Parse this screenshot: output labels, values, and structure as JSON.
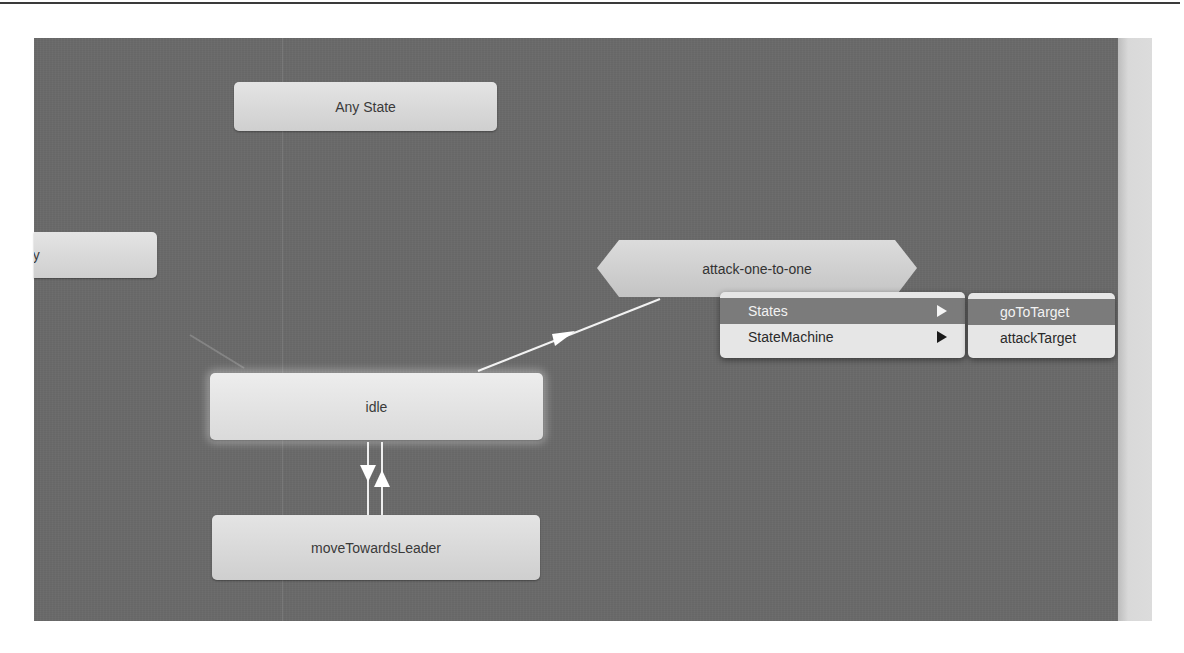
{
  "canvas": {
    "background_color": "#6a6a6a",
    "nodes": [
      {
        "id": "any-state",
        "label": "Any State"
      },
      {
        "id": "entry",
        "label": "ry"
      },
      {
        "id": "attack-one-to-one",
        "label": "attack-one-to-one"
      },
      {
        "id": "idle",
        "label": "idle"
      },
      {
        "id": "move-towards-leader",
        "label": "moveTowardsLeader"
      }
    ],
    "transitions": [
      {
        "from": "idle",
        "to": "attack-one-to-one"
      },
      {
        "from": "idle",
        "to": "moveTowardsLeader"
      },
      {
        "from": "moveTowardsLeader",
        "to": "idle"
      },
      {
        "from": "entry",
        "to": "idle"
      }
    ]
  },
  "context_menu": {
    "items": [
      {
        "label": "States",
        "has_submenu": true,
        "highlighted": true
      },
      {
        "label": "StateMachine",
        "has_submenu": true,
        "highlighted": false
      }
    ]
  },
  "submenu": {
    "items": [
      {
        "label": "goToTarget",
        "highlighted": true
      },
      {
        "label": "attackTarget",
        "highlighted": false
      }
    ]
  },
  "cursor": {
    "badge": "+",
    "icon": "copy-drag-cursor"
  }
}
